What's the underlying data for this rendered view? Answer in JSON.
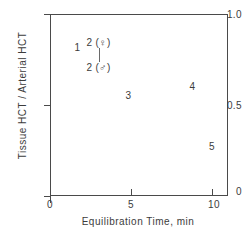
{
  "chart_data": {
    "type": "scatter",
    "title": "",
    "xlabel": "Equilibration Time, min",
    "ylabel": "Tissue HCT / Arterial HCT",
    "xlim": [
      0,
      11
    ],
    "ylim": [
      0,
      1.05
    ],
    "xticks": [
      0,
      5,
      10
    ],
    "xticklabels": [
      "0",
      "5",
      "10"
    ],
    "yticks": [
      0,
      0.5,
      1.0
    ],
    "yticklabels": [
      "0",
      "0.5",
      "1.0"
    ],
    "grid": false,
    "legend": "none",
    "marker_style": "numeric-text-labels",
    "points": [
      {
        "label": "1",
        "x": 1.7,
        "y": 0.86
      },
      {
        "label": "2 (♀)",
        "x": 3.0,
        "y": 0.89
      },
      {
        "label": "2 (♂)",
        "x": 3.0,
        "y": 0.745
      },
      {
        "label": "3",
        "x": 4.85,
        "y": 0.58
      },
      {
        "label": "4",
        "x": 8.8,
        "y": 0.635
      },
      {
        "label": "5",
        "x": 10.0,
        "y": 0.29
      }
    ],
    "annotations": [
      {
        "kind": "connector-line",
        "description": "vertical line joining the 2 (female) and 2 (male) labels",
        "x": 3.0,
        "y_top": 0.855,
        "y_bottom": 0.775
      }
    ],
    "colors": {
      "axis": "#4a4a4a",
      "text": "#3c3c3c",
      "background": "#ffffff",
      "connector": "#6a6a6a"
    }
  }
}
